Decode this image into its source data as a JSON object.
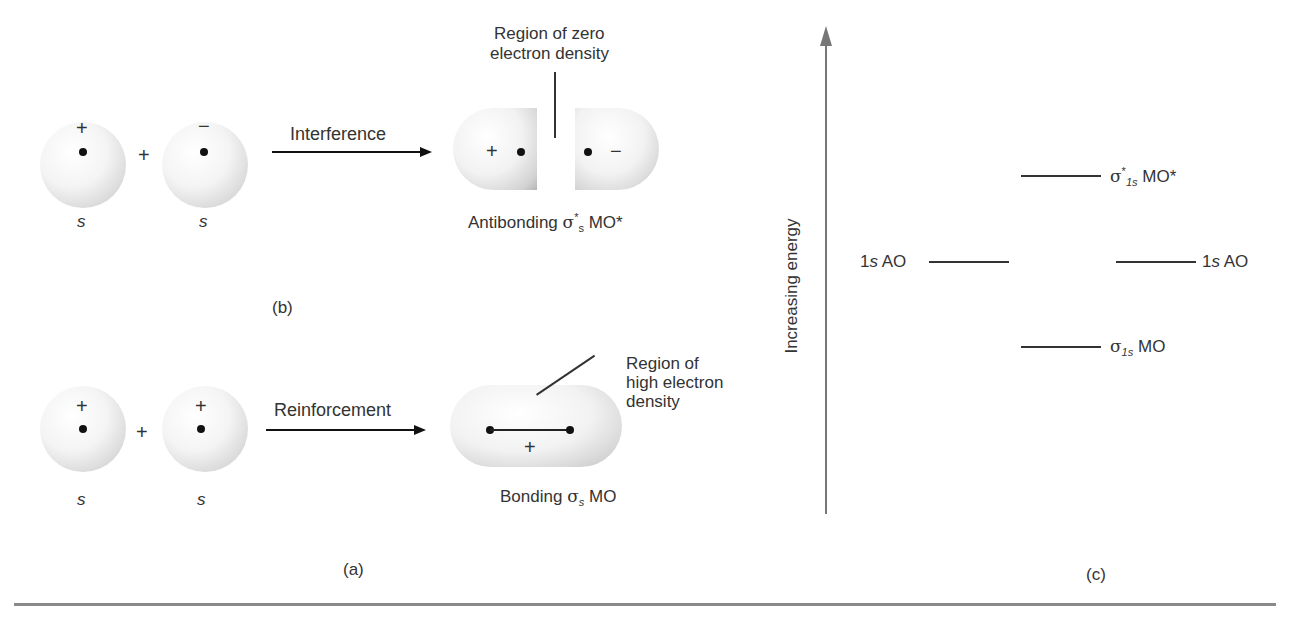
{
  "panel_b": {
    "orbital_left": {
      "sign": "+",
      "label": "s"
    },
    "operator": "+",
    "orbital_right": {
      "sign": "−",
      "label": "s"
    },
    "arrow_label": "Interference",
    "result_signs": {
      "left": "+",
      "right": "−"
    },
    "callout_line1": "Region of zero",
    "callout_line2": "electron density",
    "result_prefix": "Antibonding",
    "result_sigma": "σ",
    "result_sup": "*",
    "result_sub": "s",
    "result_suffix": "MO*",
    "panel_label": "(b)"
  },
  "panel_a": {
    "orbital_left": {
      "sign": "+",
      "label": "s"
    },
    "operator": "+",
    "orbital_right": {
      "sign": "+",
      "label": "s"
    },
    "arrow_label": "Reinforcement",
    "result_sign": "+",
    "callout_line1": "Region of",
    "callout_line2": "high electron",
    "callout_line3": "density",
    "result_prefix": "Bonding",
    "result_sigma": "σ",
    "result_sub": "s",
    "result_suffix": "MO",
    "panel_label": "(a)"
  },
  "panel_c": {
    "axis_label": "Increasing energy",
    "antibonding": {
      "sigma": "σ",
      "sup": "*",
      "sub": "1s",
      "suffix": "MO*"
    },
    "ao_left": {
      "prefix": "1",
      "ital": "s",
      "suffix": " AO"
    },
    "ao_right": {
      "prefix": "1",
      "ital": "s",
      "suffix": " AO"
    },
    "bonding": {
      "sigma": "σ",
      "sub": "1s",
      "suffix": "MO"
    },
    "panel_label": "(c)"
  }
}
